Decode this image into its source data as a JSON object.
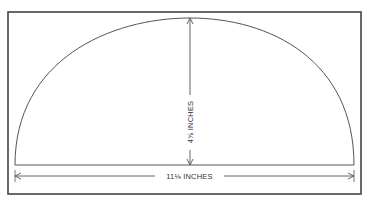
{
  "diagram": {
    "type": "dimension-drawing",
    "shape": "semi-elliptical arc",
    "dimensions": {
      "height": {
        "value": "4⅝",
        "unit": "INCHES",
        "label": "4⅝ INCHES"
      },
      "width": {
        "value": "11⅛",
        "unit": "INCHES",
        "label": "11⅛ INCHES"
      }
    },
    "colors": {
      "stroke": "#3a3a3a",
      "border": "#444444",
      "background": "#ffffff"
    }
  }
}
